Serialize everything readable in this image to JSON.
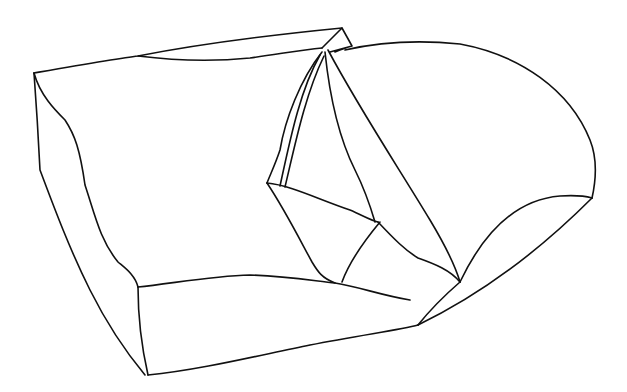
{
  "figure": {
    "colors": {
      "background": "#ffffff",
      "stroke": "#111111",
      "shade": "#e6f4f8"
    }
  }
}
